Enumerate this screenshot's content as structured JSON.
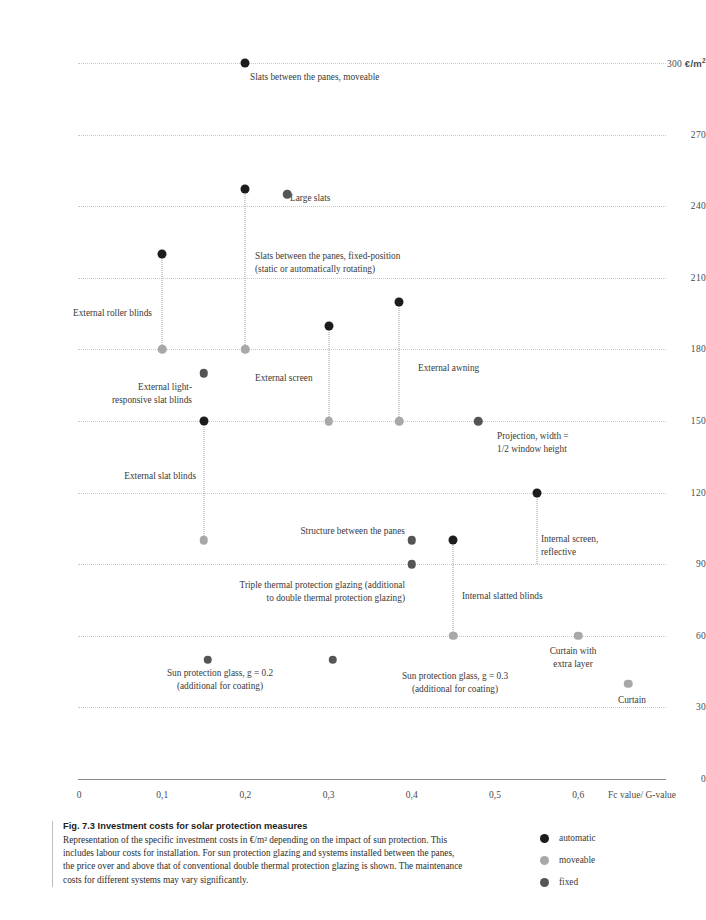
{
  "chart_data": {
    "type": "scatter",
    "title": "Fig. 7.3 Investment costs for solar protection measures",
    "xlabel": "Fc value/ G-value",
    "ylabel": "300 €/m²",
    "xlim": [
      0,
      0.68
    ],
    "ylim": [
      0,
      310
    ],
    "xticks": [
      "0",
      "0,1",
      "0,2",
      "0,3",
      "0,4",
      "0,5",
      "0,6"
    ],
    "xtick_values": [
      0,
      0.1,
      0.2,
      0.3,
      0.4,
      0.5,
      0.6
    ],
    "yticks": [
      "300 €/m²",
      "270",
      "240",
      "210",
      "180",
      "150",
      "120",
      "90",
      "60",
      "30",
      "0"
    ],
    "ytick_values": [
      300,
      270,
      240,
      210,
      180,
      150,
      120,
      90,
      60,
      30,
      0
    ],
    "grid": "horizontal-dotted",
    "legend_position": "bottom-right",
    "legend": [
      {
        "key": "automatic",
        "label": "automatic",
        "color": "#1c1c1c"
      },
      {
        "key": "moveable",
        "label": "moveable",
        "color": "#a8a8a8"
      },
      {
        "key": "fixed",
        "label": "fixed",
        "color": "#555555"
      }
    ],
    "points": [
      {
        "name": "slats-between-panes-moveable",
        "x": 0.2,
        "y": 300,
        "category": "automatic"
      },
      {
        "name": "large-slats-top",
        "x": 0.2,
        "y": 247,
        "category": "automatic"
      },
      {
        "name": "large-slats",
        "x": 0.25,
        "y": 245,
        "category": "fixed"
      },
      {
        "name": "slats-between-panes-fixed",
        "x": 0.2,
        "y": 180,
        "category": "moveable"
      },
      {
        "name": "external-roller-blinds-top",
        "x": 0.1,
        "y": 220,
        "category": "automatic"
      },
      {
        "name": "external-roller-blinds-bottom",
        "x": 0.1,
        "y": 180,
        "category": "moveable"
      },
      {
        "name": "external-awning-top",
        "x": 0.385,
        "y": 200,
        "category": "automatic"
      },
      {
        "name": "external-awning-bottom",
        "x": 0.385,
        "y": 150,
        "category": "moveable"
      },
      {
        "name": "external-screen-top",
        "x": 0.3,
        "y": 190,
        "category": "automatic"
      },
      {
        "name": "external-screen-bottom",
        "x": 0.3,
        "y": 150,
        "category": "moveable"
      },
      {
        "name": "external-light-responsive-slat-blinds",
        "x": 0.15,
        "y": 170,
        "category": "fixed"
      },
      {
        "name": "external-slat-blinds-top",
        "x": 0.15,
        "y": 150,
        "category": "automatic"
      },
      {
        "name": "external-slat-blinds-bottom",
        "x": 0.15,
        "y": 100,
        "category": "moveable"
      },
      {
        "name": "projection-half-window-height",
        "x": 0.48,
        "y": 150,
        "category": "fixed"
      },
      {
        "name": "internal-screen-reflective-top",
        "x": 0.55,
        "y": 120,
        "category": "automatic"
      },
      {
        "name": "structure-between-panes",
        "x": 0.4,
        "y": 100,
        "category": "fixed"
      },
      {
        "name": "triple-thermal-protection-glazing",
        "x": 0.4,
        "y": 90,
        "category": "fixed"
      },
      {
        "name": "internal-slatted-blinds-top",
        "x": 0.45,
        "y": 100,
        "category": "automatic"
      },
      {
        "name": "internal-slatted-blinds-bottom",
        "x": 0.45,
        "y": 60,
        "category": "moveable"
      },
      {
        "name": "curtain-with-extra-layer",
        "x": 0.6,
        "y": 60,
        "category": "moveable"
      },
      {
        "name": "sun-protection-glass-g02",
        "x": 0.155,
        "y": 50,
        "category": "fixed"
      },
      {
        "name": "sun-protection-glass-g03",
        "x": 0.305,
        "y": 50,
        "category": "fixed"
      },
      {
        "name": "curtain",
        "x": 0.66,
        "y": 40,
        "category": "moveable"
      }
    ],
    "connectors": [
      {
        "name": "connector-external-roller-blinds",
        "x": 0.1,
        "y_top": 220,
        "y_bottom": 180
      },
      {
        "name": "connector-slats-between-panes",
        "x": 0.2,
        "y_top": 247,
        "y_bottom": 180
      },
      {
        "name": "connector-external-screen",
        "x": 0.3,
        "y_top": 190,
        "y_bottom": 150
      },
      {
        "name": "connector-external-awning",
        "x": 0.385,
        "y_top": 200,
        "y_bottom": 150
      },
      {
        "name": "connector-external-slat-blinds",
        "x": 0.15,
        "y_top": 150,
        "y_bottom": 100
      },
      {
        "name": "connector-internal-slatted-blinds",
        "x": 0.45,
        "y_top": 100,
        "y_bottom": 60
      },
      {
        "name": "connector-internal-screen",
        "x": 0.55,
        "y_top": 120,
        "y_bottom": 90
      }
    ],
    "annotations": [
      {
        "name": "annotation-slats-between-panes-moveable",
        "text": "Slats between the panes, moveable",
        "align": "left",
        "left": 250,
        "top": 71
      },
      {
        "name": "annotation-large-slats",
        "text": "Large slats",
        "align": "left",
        "left": 290,
        "top": 192
      },
      {
        "name": "annotation-slats-between-panes-fixed",
        "text": "Slats between the panes, fixed-position\n(static or automatically rotating)",
        "align": "left",
        "left": 255,
        "top": 250
      },
      {
        "name": "annotation-external-roller-blinds",
        "text": "External roller blinds",
        "align": "right",
        "left": 0,
        "top": 307,
        "width": 152
      },
      {
        "name": "annotation-external-light-responsive-slat-blinds",
        "text": "External light-\nresponsive slat blinds",
        "align": "right",
        "left": 0,
        "top": 381,
        "width": 192
      },
      {
        "name": "annotation-external-screen",
        "text": "External screen",
        "align": "left",
        "left": 255,
        "top": 372
      },
      {
        "name": "annotation-external-awning",
        "text": "External awning",
        "align": "left",
        "left": 418,
        "top": 362
      },
      {
        "name": "annotation-projection",
        "text": "Projection, width =\n1/2 window height",
        "align": "left",
        "left": 497,
        "top": 430
      },
      {
        "name": "annotation-external-slat-blinds",
        "text": "External slat blinds",
        "align": "right",
        "left": 0,
        "top": 470,
        "width": 196
      },
      {
        "name": "annotation-structure-between-panes",
        "text": "Structure between the panes",
        "align": "right",
        "left": 0,
        "top": 525,
        "width": 405
      },
      {
        "name": "annotation-internal-screen-reflective",
        "text": "Internal screen,\nreflective",
        "align": "left",
        "left": 541,
        "top": 533
      },
      {
        "name": "annotation-triple-thermal-protection-glazing",
        "text": "Triple thermal protection glazing (additional\nto double thermal protection glazing)",
        "align": "right",
        "left": 0,
        "top": 579,
        "width": 405
      },
      {
        "name": "annotation-internal-slatted-blinds",
        "text": "Internal slatted blinds",
        "align": "left",
        "left": 462,
        "top": 590
      },
      {
        "name": "annotation-curtain-with-extra-layer",
        "text": "Curtain with\nextra layer",
        "align": "center",
        "left": 498,
        "top": 645,
        "width": 150
      },
      {
        "name": "annotation-sun-protection-glass-g02",
        "text": "Sun protection glass, g = 0.2\n(additional for coating)",
        "align": "center",
        "left": 95,
        "top": 667,
        "width": 250
      },
      {
        "name": "annotation-sun-protection-glass-g03",
        "text": "Sun protection glass, g = 0.3\n(additional for coating)",
        "align": "center",
        "left": 330,
        "top": 670,
        "width": 250
      },
      {
        "name": "annotation-curtain",
        "text": "Curtain",
        "align": "left",
        "left": 618,
        "top": 694
      }
    ]
  },
  "caption": {
    "title": "Fig. 7.3 Investment costs for solar protection measures",
    "body": "Representation of the specific investment costs in €/m² depending on the impact of sun protection. This includes labour costs for installation. For sun protection glazing and systems installed between the panes, the price over and above that of conventional double thermal protection glazing is shown. The maintenance costs for different systems may vary significantly."
  }
}
